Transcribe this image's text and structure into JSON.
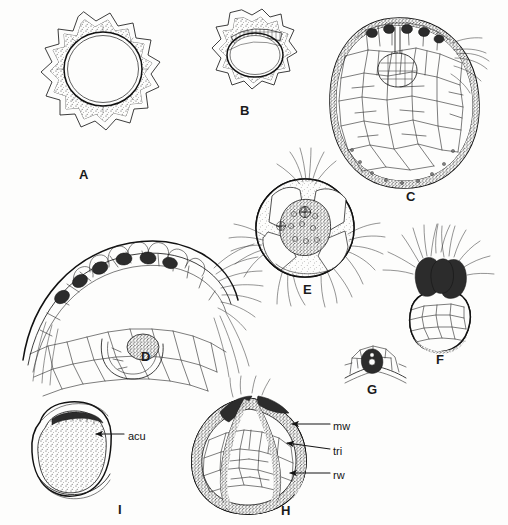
{
  "figure": {
    "kind": "scientific-plate",
    "background_color": "#fdfdfc",
    "ink_color": "#1b1b1b",
    "width": 508,
    "height": 525
  },
  "panels": [
    {
      "id": "A",
      "letter": "A",
      "x": 79,
      "y": 168,
      "subject": "thick-walled spiny ring in transverse section"
    },
    {
      "id": "B",
      "letter": "B",
      "x": 240,
      "y": 104,
      "subject": "smaller rounded section with crenate outer wall"
    },
    {
      "id": "C",
      "letter": "C",
      "x": 406,
      "y": 190,
      "subject": "large ovoid body in longitudinal section showing cell mosaic"
    },
    {
      "id": "D",
      "letter": "D",
      "x": 141,
      "y": 350,
      "subject": "arc of surface tissue with glandular hairs and bristles"
    },
    {
      "id": "E",
      "letter": "E",
      "x": 303,
      "y": 283,
      "subject": "globose body with tufted bristle clusters"
    },
    {
      "id": "F",
      "letter": "F",
      "x": 436,
      "y": 353,
      "subject": "lobed body with dense apical hairs"
    },
    {
      "id": "G",
      "letter": "G",
      "x": 367,
      "y": 383,
      "subject": "detail of a single cell group in surface view"
    },
    {
      "id": "H",
      "letter": "H",
      "x": 281,
      "y": 504,
      "subject": "whole body showing wall layers, with callouts"
    },
    {
      "id": "I",
      "letter": "I",
      "x": 118,
      "y": 503,
      "subject": "rounded granular body with aculeus"
    }
  ],
  "callouts": [
    {
      "id": "acu",
      "text": "acu",
      "panel": "I",
      "label_x": 128,
      "label_y": 431,
      "leader_from_x": 124,
      "leader_from_y": 434,
      "leader_to_x": 96,
      "leader_to_y": 434,
      "arrow": true
    },
    {
      "id": "mw",
      "text": "mw",
      "panel": "H",
      "label_x": 333,
      "label_y": 421,
      "leader_from_x": 330,
      "leader_from_y": 424,
      "leader_to_x": 292,
      "leader_to_y": 424,
      "arrow": true
    },
    {
      "id": "tri",
      "text": "tri",
      "panel": "H",
      "label_x": 333,
      "label_y": 446,
      "leader_from_x": 330,
      "leader_from_y": 449,
      "leader_to_x": 287,
      "leader_to_y": 443,
      "arrow": true
    },
    {
      "id": "rw",
      "text": "rw",
      "panel": "H",
      "label_x": 333,
      "label_y": 470,
      "leader_from_x": 330,
      "leader_from_y": 473,
      "leader_to_x": 290,
      "leader_to_y": 473,
      "arrow": true
    }
  ]
}
